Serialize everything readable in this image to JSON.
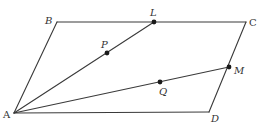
{
  "diagram": {
    "stroke_color": "#3a3a3a",
    "point_color": "#1a1a1a",
    "vertices": {
      "A": {
        "label": "A",
        "x": 14,
        "y": 113
      },
      "B": {
        "label": "B",
        "x": 57,
        "y": 22
      },
      "C": {
        "label": "C",
        "x": 246,
        "y": 22
      },
      "D": {
        "label": "D",
        "x": 209,
        "y": 112
      }
    },
    "points": {
      "L": {
        "label": "L",
        "x": 154,
        "y": 22,
        "on": "BC"
      },
      "M": {
        "label": "M",
        "x": 229,
        "y": 67,
        "on": "CD"
      },
      "P": {
        "label": "P",
        "x": 107,
        "y": 53,
        "on": "AL"
      },
      "Q": {
        "label": "Q",
        "x": 160,
        "y": 82,
        "on": "AM"
      }
    },
    "segments": [
      "AB",
      "BC",
      "CD",
      "DA",
      "AL",
      "AM"
    ]
  }
}
